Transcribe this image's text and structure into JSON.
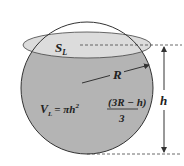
{
  "diagram": {
    "type": "spherical-cap-liquid-volume",
    "labels": {
      "surface": "S",
      "surface_sub": "L",
      "radius": "R",
      "height": "h",
      "volume_lhs": "V",
      "volume_sub": "L",
      "volume_eq": "= πh",
      "volume_exp": "2",
      "numerator": "(3R − h)",
      "denominator": "3"
    },
    "colors": {
      "liquid": "#b4b4b4",
      "surface": "#dcdcdc",
      "outline": "#333333",
      "background": "#ffffff"
    }
  }
}
